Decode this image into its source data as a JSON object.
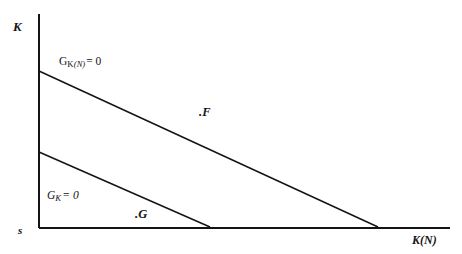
{
  "figure": {
    "background_color": "#ffffff",
    "line_color": "#141414",
    "width": 462,
    "height": 254
  },
  "axes": {
    "y_label": "K",
    "x_label": "K(N)",
    "origin_label": "s",
    "x_axis": {
      "x_start": 39,
      "x_end": 450,
      "y": 228
    },
    "y_axis": {
      "x": 39,
      "y_start": 14,
      "y_end": 228
    }
  },
  "curves": {
    "upper": {
      "label_prefix": "G",
      "label_sub_main": "K",
      "label_sub_paren": "(N)",
      "label_suffix": "= 0",
      "label_text": "GK(N) = 0",
      "x1": 39,
      "y1": 71,
      "x2": 378,
      "y2": 227
    },
    "lower": {
      "label_prefix": "G",
      "label_sub_main": "K",
      "label_suffix": "= 0",
      "label_text": "GK = 0",
      "x1": 39,
      "y1": 152,
      "x2": 210,
      "y2": 227
    }
  },
  "points": [
    {
      "name": "F",
      "label": ".F",
      "x": 199,
      "y": 106
    },
    {
      "name": "G",
      "label": ".G",
      "x": 135,
      "y": 208
    }
  ],
  "chart_data": {
    "type": "line",
    "title": "",
    "xlabel": "K(N)",
    "ylabel": "K",
    "grid": false,
    "legend": "none",
    "annotations": [
      {
        "text": "GK(N) = 0",
        "kind": "curve-label"
      },
      {
        "text": "GK = 0",
        "kind": "curve-label"
      },
      {
        "text": ".F",
        "kind": "point-label"
      },
      {
        "text": ".G",
        "kind": "point-label"
      },
      {
        "text": "s",
        "kind": "origin-label"
      }
    ],
    "axis_origin_label": "s",
    "xlim": [
      0,
      1
    ],
    "ylim": [
      0,
      1
    ],
    "series": [
      {
        "name": "GK(N) = 0",
        "x": [
          0.0,
          0.825
        ],
        "y": [
          0.734,
          0.005
        ]
      },
      {
        "name": "GK = 0",
        "x": [
          0.0,
          0.416
        ],
        "y": [
          0.355,
          0.005
        ]
      }
    ],
    "points": [
      {
        "name": "F",
        "x": 0.42,
        "y": 0.57
      },
      {
        "name": "G",
        "x": 0.25,
        "y": 0.1
      }
    ]
  }
}
